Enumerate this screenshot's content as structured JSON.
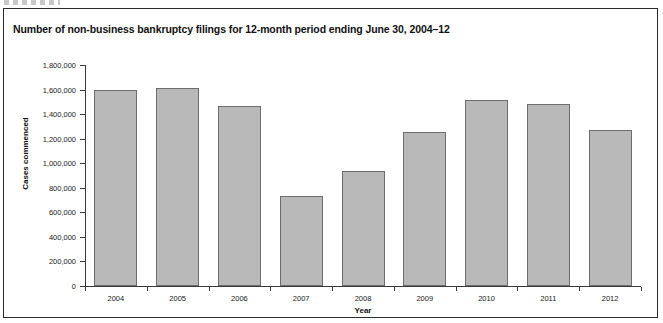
{
  "figure": {
    "title": "Number of non-business bankruptcy filings for 12-month period ending June 30, 2004–12",
    "border_color": "#2b2b2b",
    "background": "#ffffff"
  },
  "chart_data": {
    "type": "bar",
    "title": "Number of non-business bankruptcy filings for 12-month period ending June 30, 2004–12",
    "xlabel": "Year",
    "ylabel": "Cases commenced",
    "categories": [
      "2004",
      "2005",
      "2006",
      "2007",
      "2008",
      "2009",
      "2010",
      "2011",
      "2012"
    ],
    "values": [
      1600000,
      1610000,
      1470000,
      735000,
      940000,
      1255000,
      1515000,
      1480000,
      1270000
    ],
    "ylim": [
      0,
      1800000
    ],
    "ytick_values": [
      0,
      200000,
      400000,
      600000,
      800000,
      1000000,
      1200000,
      1400000,
      1600000,
      1800000
    ],
    "ytick_labels": [
      "0",
      "200,000",
      "400,000",
      "600,000",
      "800,000",
      "1,000,000",
      "1,200,000",
      "1,400,000",
      "1,600,000",
      "1,800,000"
    ],
    "grid": false,
    "legend": null,
    "bar_fill_color": "#b9b9b9",
    "bar_edge_color": "#6e6e6e",
    "axis_color": "#3a3a3a"
  }
}
